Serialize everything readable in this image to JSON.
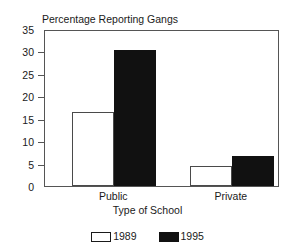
{
  "chart_data": {
    "type": "bar",
    "title": "Percentage Reporting Gangs",
    "xlabel": "Type of School",
    "ylabel": "",
    "categories": [
      "Public",
      "Private"
    ],
    "series": [
      {
        "name": "1989",
        "values": [
          16.5,
          4.5
        ],
        "style": "open"
      },
      {
        "name": "1995",
        "values": [
          30.3,
          6.8
        ],
        "style": "filled"
      }
    ],
    "ylim": [
      0,
      35
    ],
    "yticks": [
      0,
      5,
      10,
      15,
      20,
      25,
      30,
      35
    ],
    "ytick_labels": [
      "0",
      "5",
      "10",
      "15",
      "20",
      "25",
      "30",
      "35"
    ],
    "grid": false,
    "legend_position": "bottom-center"
  },
  "legend": {
    "entries": [
      {
        "label": "1989"
      },
      {
        "label": "1995"
      }
    ]
  }
}
